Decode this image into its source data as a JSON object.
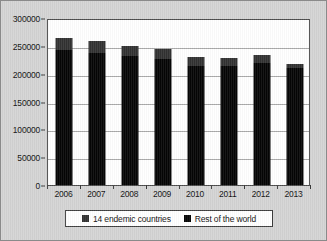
{
  "chart_data": {
    "type": "bar",
    "subtype": "stacked-column",
    "title": "",
    "subtitle": "",
    "xlabel": "",
    "ylabel": "",
    "categories": [
      "2006",
      "2007",
      "2008",
      "2009",
      "2010",
      "2011",
      "2012",
      "2013"
    ],
    "series": [
      {
        "name": "Rest of the world",
        "color": "#050505",
        "values": [
          242000,
          238000,
          231000,
          227000,
          213000,
          213000,
          220000,
          210000
        ]
      },
      {
        "name": "14 endemic countries",
        "color": "#313131",
        "values": [
          23000,
          20000,
          19000,
          18000,
          17000,
          15000,
          14000,
          8000
        ]
      }
    ],
    "totals": [
      265000,
      258000,
      250000,
      245000,
      230000,
      228000,
      234000,
      218000
    ],
    "ylim": [
      0,
      300000
    ],
    "yticks": [
      0,
      50000,
      100000,
      150000,
      200000,
      250000,
      300000
    ],
    "ytick_labels": [
      "0",
      "50000",
      "100000",
      "150000",
      "200000",
      "250000",
      "300000"
    ],
    "grid": true,
    "legend_position": "bottom",
    "legend_entries": [
      {
        "label": "14 endemic countries",
        "color": "#313131",
        "swatch": "square-swatch"
      },
      {
        "label": "Rest of the world",
        "color": "#050505",
        "swatch": "square-swatch"
      }
    ],
    "plot_background": "#ffffff",
    "figure_background": "#d4d4d4"
  }
}
